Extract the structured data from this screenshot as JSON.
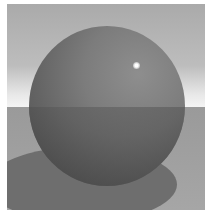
{
  "image": {
    "description": "Rendered glossy grey sphere on a flat plane with horizon and cast shadow",
    "colors": {
      "sky_top": "#aaaaaa",
      "sky_horizon": "#f4f4f4",
      "floor": "#a0a0a0",
      "sphere": "#747474",
      "shadow": "#6e6e6e",
      "highlight": "#ffffff"
    }
  }
}
